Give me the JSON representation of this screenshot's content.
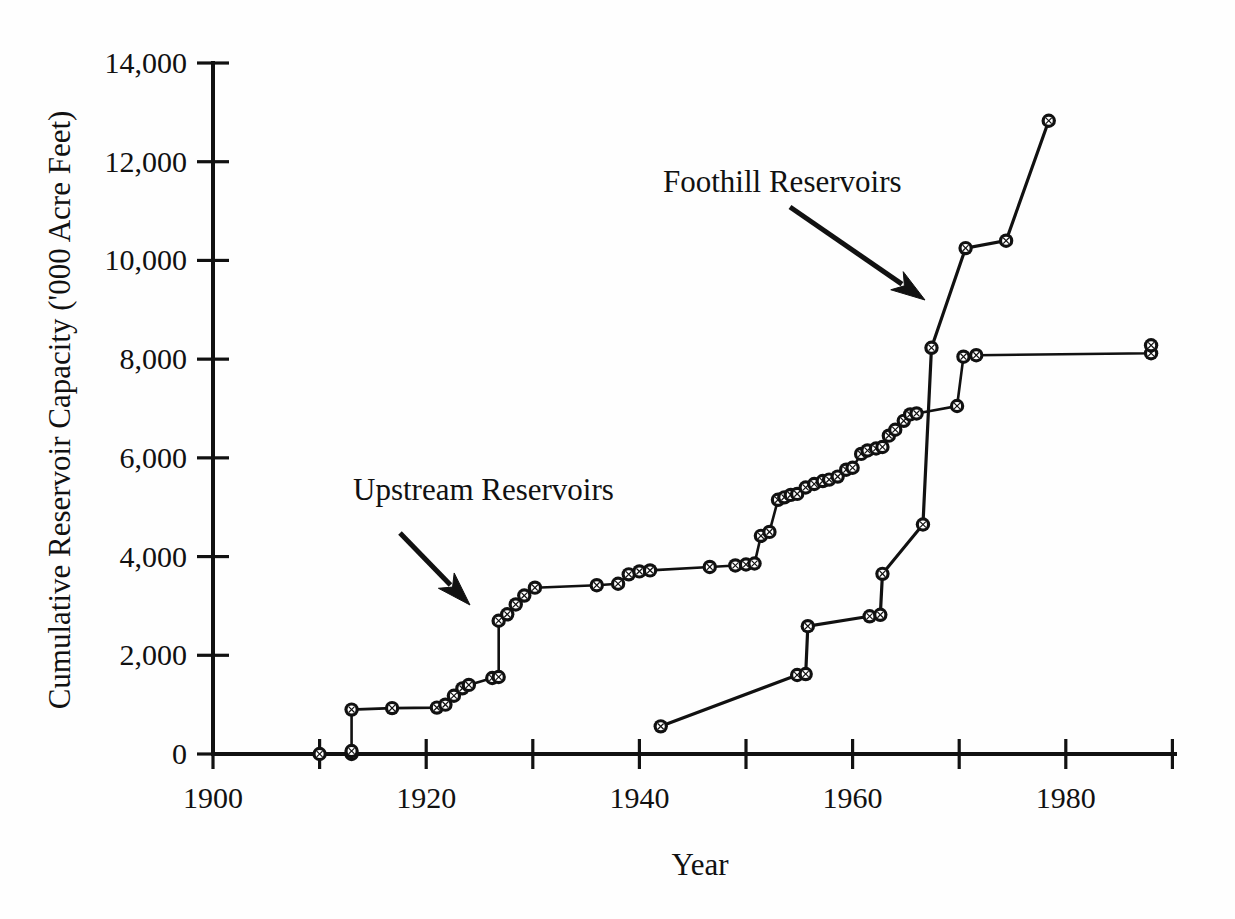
{
  "chart_data": {
    "type": "line",
    "title": "",
    "xlabel": "Year",
    "ylabel": "Cumulative Reservoir Capacity ('000 Acre Feet)",
    "xlim": [
      1900,
      1990
    ],
    "ylim": [
      0,
      14000
    ],
    "x_ticks": [
      1900,
      1910,
      1920,
      1930,
      1940,
      1950,
      1960,
      1970,
      1980,
      1990
    ],
    "x_tick_labels": [
      "1900",
      "",
      "1920",
      "",
      "1940",
      "",
      "1960",
      "",
      "1980",
      ""
    ],
    "x_major_labels": [
      "1900",
      "1920",
      "1940",
      "1960",
      "1980"
    ],
    "y_ticks": [
      0,
      2000,
      4000,
      6000,
      8000,
      10000,
      12000,
      14000
    ],
    "y_tick_labels": [
      "0",
      "2,000",
      "4,000",
      "6,000",
      "8,000",
      "10,000",
      "12,000",
      "14,000"
    ],
    "grid": false,
    "legend": "none",
    "marker": "circle-with-cross",
    "series": [
      {
        "name": "Upstream Reservoirs",
        "points": [
          [
            1910.0,
            0
          ],
          [
            1913.0,
            0
          ],
          [
            1913.0,
            60
          ],
          [
            1913.0,
            900
          ],
          [
            1916.8,
            930
          ],
          [
            1921.0,
            940
          ],
          [
            1921.8,
            1000
          ],
          [
            1922.6,
            1180
          ],
          [
            1923.4,
            1330
          ],
          [
            1924.0,
            1400
          ],
          [
            1926.2,
            1540
          ],
          [
            1926.8,
            1560
          ],
          [
            1926.8,
            2700
          ],
          [
            1927.6,
            2830
          ],
          [
            1928.4,
            3030
          ],
          [
            1929.2,
            3210
          ],
          [
            1930.2,
            3370
          ],
          [
            1936.0,
            3420
          ],
          [
            1938.0,
            3450
          ],
          [
            1939.0,
            3640
          ],
          [
            1940.0,
            3700
          ],
          [
            1941.0,
            3720
          ],
          [
            1946.6,
            3790
          ],
          [
            1949.0,
            3820
          ],
          [
            1950.0,
            3840
          ],
          [
            1950.8,
            3860
          ],
          [
            1951.4,
            4420
          ],
          [
            1952.2,
            4500
          ],
          [
            1953.0,
            5150
          ],
          [
            1953.6,
            5200
          ],
          [
            1954.2,
            5250
          ],
          [
            1954.8,
            5270
          ],
          [
            1955.6,
            5400
          ],
          [
            1956.4,
            5470
          ],
          [
            1957.2,
            5530
          ],
          [
            1957.8,
            5560
          ],
          [
            1958.6,
            5620
          ],
          [
            1959.4,
            5760
          ],
          [
            1960.0,
            5800
          ],
          [
            1960.8,
            6080
          ],
          [
            1961.4,
            6150
          ],
          [
            1962.2,
            6190
          ],
          [
            1962.8,
            6220
          ],
          [
            1963.4,
            6450
          ],
          [
            1964.0,
            6570
          ],
          [
            1964.8,
            6750
          ],
          [
            1965.4,
            6880
          ],
          [
            1966.0,
            6900
          ],
          [
            1969.8,
            7050
          ],
          [
            1970.4,
            8050
          ],
          [
            1971.6,
            8080
          ],
          [
            1988.0,
            8120
          ],
          [
            1988.0,
            8280
          ]
        ]
      },
      {
        "name": "Foothill Reservoirs",
        "points": [
          [
            1942.0,
            560
          ],
          [
            1954.8,
            1600
          ],
          [
            1955.6,
            1620
          ],
          [
            1955.8,
            2590
          ],
          [
            1961.6,
            2790
          ],
          [
            1962.6,
            2820
          ],
          [
            1962.8,
            3650
          ],
          [
            1966.6,
            4650
          ],
          [
            1967.4,
            8230
          ],
          [
            1970.6,
            10250
          ],
          [
            1974.4,
            10400
          ],
          [
            1978.4,
            12830
          ]
        ]
      }
    ],
    "annotations": [
      {
        "text": "Upstream Reservoirs",
        "text_x": 353,
        "text_y": 500,
        "arrow_from": [
          400,
          533
        ],
        "arrow_to": [
          470,
          605
        ]
      },
      {
        "text": "Foothill Reservoirs",
        "text_x": 663,
        "text_y": 192,
        "arrow_from": [
          790,
          207
        ],
        "arrow_to": [
          925,
          300
        ]
      }
    ]
  },
  "geometry": {
    "plot_origin_x": 213,
    "plot_origin_y": 754,
    "px_per_year": 10.66,
    "px_per_unit": 0.049357,
    "axis_right_x": 1175,
    "axis_top_y": 63
  }
}
